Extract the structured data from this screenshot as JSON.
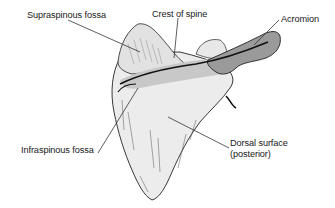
{
  "figure": {
    "colors": {
      "bone_fill": "#ececec",
      "bone_shadow": "#b8b8b8",
      "acromion_fill": "#9a9a9a",
      "outline": "#222222",
      "leader_line": "#333333",
      "text": "#1a1a1a"
    }
  },
  "labels": {
    "supraspinous_fossa": "Supraspinous fossa",
    "crest_of_spine": "Crest of spine",
    "acromion": "Acromion",
    "infraspinous_fossa": "Infraspinous fossa",
    "dorsal_surface_line1": "Dorsal surface",
    "dorsal_surface_line2": "(posterior)"
  }
}
